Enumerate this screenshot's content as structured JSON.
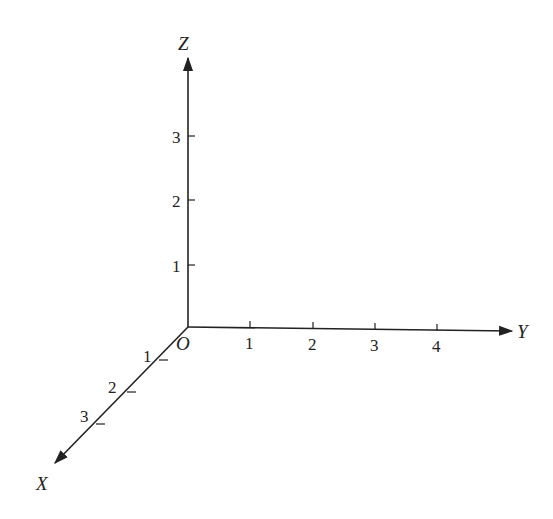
{
  "diagram": {
    "origin_label": "O",
    "axes": {
      "x": {
        "label": "X",
        "ticks": [
          "1",
          "2",
          "3"
        ]
      },
      "y": {
        "label": "Y",
        "ticks": [
          "1",
          "2",
          "3",
          "4"
        ]
      },
      "z": {
        "label": "Z",
        "ticks": [
          "1",
          "2",
          "3"
        ]
      }
    },
    "colors": {
      "line": "#222222",
      "background": "#ffffff"
    }
  }
}
